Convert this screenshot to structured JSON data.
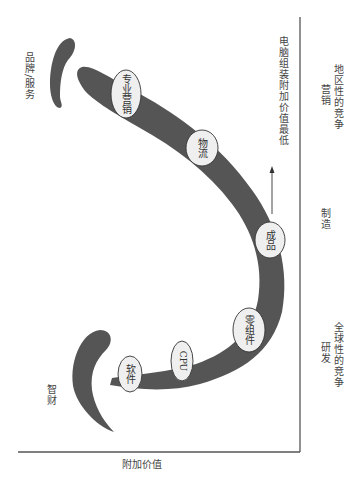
{
  "diagram": {
    "type": "smile-curve",
    "orientation": "rotated-90-clockwise",
    "colors": {
      "curve": "#555555",
      "node_fill": "#efefef",
      "node_stroke": "#333333",
      "axis": "#555555",
      "text": "#444444"
    },
    "axes": {
      "y_label": "附加价值",
      "x_sections": [
        {
          "id": "rd",
          "line1": "研发",
          "line2": "全球性的竞争"
        },
        {
          "id": "manufacturing",
          "line1": "制造",
          "line2": ""
        },
        {
          "id": "marketing",
          "line1": "营销",
          "line2": "地区性的竞争"
        }
      ]
    },
    "ends": {
      "left_label": "智财",
      "right_label": "品牌/服务"
    },
    "nodes": [
      {
        "id": "software",
        "label": "软件"
      },
      {
        "id": "cpu",
        "label": "CPU"
      },
      {
        "id": "components",
        "label": "零组件"
      },
      {
        "id": "product",
        "label": "成品"
      },
      {
        "id": "logistics",
        "label": "物流"
      },
      {
        "id": "marketing",
        "label": "专业营销"
      }
    ],
    "annotation": "电脑组装附加价值最低"
  }
}
